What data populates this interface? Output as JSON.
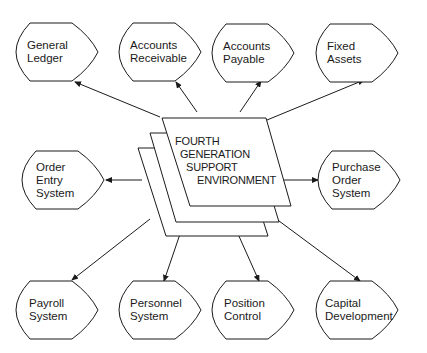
{
  "center": {
    "lines": [
      "FOURTH",
      "GENERATION",
      "SUPPORT",
      "ENVIRONMENT"
    ]
  },
  "nodes": [
    {
      "id": "general-ledger",
      "lines": [
        "General",
        "Ledger"
      ]
    },
    {
      "id": "accounts-receivable",
      "lines": [
        "Accounts",
        "Receivable"
      ]
    },
    {
      "id": "accounts-payable",
      "lines": [
        "Accounts",
        "Payable"
      ]
    },
    {
      "id": "fixed-assets",
      "lines": [
        "Fixed",
        "Assets"
      ]
    },
    {
      "id": "order-entry-system",
      "lines": [
        "Order",
        "Entry",
        "System"
      ]
    },
    {
      "id": "purchase-order-system",
      "lines": [
        "Purchase",
        "Order",
        "System"
      ]
    },
    {
      "id": "payroll-system",
      "lines": [
        "Payroll",
        "System"
      ]
    },
    {
      "id": "personnel-system",
      "lines": [
        "Personnel",
        "System"
      ]
    },
    {
      "id": "position-control",
      "lines": [
        "Position",
        "Control"
      ]
    },
    {
      "id": "capital-development",
      "lines": [
        "Capital",
        "Development"
      ]
    }
  ],
  "colors": {
    "stroke": "#1a1a1a",
    "background": "#ffffff"
  }
}
